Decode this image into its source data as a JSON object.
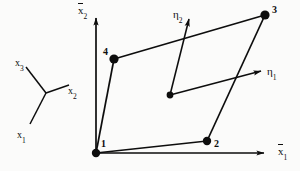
{
  "figure": {
    "background_color": "#fbfbfa",
    "ink_color": "#0d0d0d"
  },
  "global_axes": {
    "vertical": {
      "symbol": "x",
      "subscript": "2",
      "overbar": true,
      "label": "x̄2",
      "x": 78,
      "y": 5
    },
    "horizontal": {
      "symbol": "x",
      "subscript": "1",
      "overbar": true,
      "label": "x̄1",
      "x": 278,
      "y": 146
    }
  },
  "triad_axes": [
    {
      "name": "x3",
      "symbol": "x",
      "subscript": "3",
      "x": 15,
      "y": 58
    },
    {
      "name": "x2",
      "symbol": "x",
      "subscript": "2",
      "x": 68,
      "y": 86
    },
    {
      "name": "x1",
      "symbol": "x",
      "subscript": "1",
      "x": 17,
      "y": 130
    }
  ],
  "natural_axes": [
    {
      "name": "eta1",
      "symbol": "η",
      "subscript": "1",
      "x": 267,
      "y": 66
    },
    {
      "name": "eta2",
      "symbol": "η",
      "subscript": "2",
      "x": 173,
      "y": 9
    }
  ],
  "nodes": [
    {
      "id": "1",
      "label": "1",
      "cx": 96,
      "cy": 153,
      "label_x": 101,
      "label_y": 139
    },
    {
      "id": "2",
      "label": "2",
      "cx": 207,
      "cy": 141,
      "label_x": 214,
      "label_y": 139
    },
    {
      "id": "3",
      "label": "3",
      "cx": 265,
      "cy": 15,
      "label_x": 272,
      "label_y": 5
    },
    {
      "id": "4",
      "label": "4",
      "cx": 114,
      "cy": 59,
      "label_x": 103,
      "label_y": 47
    }
  ],
  "element_center": {
    "cx": 170,
    "cy": 95
  },
  "edges": [
    {
      "from": "1",
      "to": "2"
    },
    {
      "from": "2",
      "to": "3"
    },
    {
      "from": "3",
      "to": "4"
    },
    {
      "from": "4",
      "to": "1"
    }
  ]
}
